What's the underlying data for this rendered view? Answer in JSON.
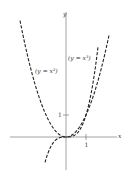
{
  "chart_data": {
    "type": "line",
    "title": "",
    "xlabel": "x",
    "ylabel": "y",
    "xlim": [
      -2.8,
      2.6
    ],
    "ylim": [
      -1.5,
      5.7
    ],
    "grid": false,
    "legend_position": "none",
    "series": [
      {
        "name": "y = x^2",
        "label": "(y = x²)",
        "style": "dashed",
        "color": "#222222",
        "x": [
          -2.3,
          -2.0,
          -1.5,
          -1.0,
          -0.5,
          0,
          0.5,
          1.0,
          1.5,
          2.0,
          2.15
        ],
        "y": [
          5.29,
          4.0,
          2.25,
          1.0,
          0.25,
          0,
          0.25,
          1.0,
          2.25,
          4.0,
          4.62
        ]
      },
      {
        "name": "y = x^3",
        "label": "(y = x³)",
        "style": "dashed",
        "color": "#222222",
        "x": [
          -1.05,
          -0.75,
          -0.5,
          -0.25,
          0,
          0.25,
          0.5,
          0.75,
          1.0,
          1.25,
          1.5,
          1.6
        ],
        "y": [
          -1.16,
          -0.42,
          -0.125,
          -0.016,
          0,
          0.016,
          0.125,
          0.42,
          1.0,
          1.95,
          3.375,
          4.1
        ]
      }
    ],
    "annotations": [
      {
        "text": "(y = x²)",
        "x": -1.85,
        "y": 2.9
      },
      {
        "text": "(y = x³)",
        "x": 0.35,
        "y": 3.5
      }
    ],
    "ticks": {
      "x": [
        {
          "value": 1,
          "label": "1"
        }
      ],
      "y": [
        {
          "value": 1,
          "label": "1"
        }
      ]
    }
  },
  "labels": {
    "x_axis": "x",
    "y_axis": "y",
    "x_tick_1": "1",
    "y_tick_1": "1",
    "parabola": "(y = x²)",
    "cubic": "(y = x³)"
  }
}
